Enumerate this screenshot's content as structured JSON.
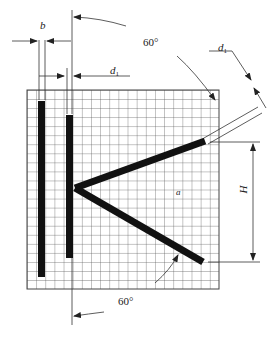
{
  "diagram": {
    "type": "technical-drawing",
    "labels": {
      "b": "b",
      "d1_top": "d",
      "d1_top_sub": "1",
      "d1_right": "d",
      "d1_right_sub": "1",
      "angle_top": "60°",
      "angle_bottom": "60°",
      "a": "a",
      "H": "H"
    },
    "grid": {
      "x": 27,
      "y": 90,
      "width": 192,
      "height": 199,
      "cell": 9.1,
      "color": "#444444"
    },
    "colors": {
      "bars": "#111111",
      "lines": "#333333",
      "background": "#ffffff"
    }
  }
}
